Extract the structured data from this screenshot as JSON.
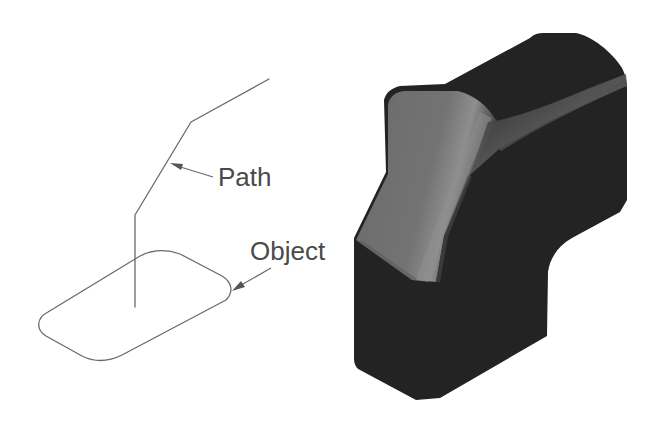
{
  "diagram": {
    "type": "sweep-illustration",
    "labels": {
      "path": "Path",
      "object": "Object"
    },
    "left_panel": {
      "description": "Wireframe: a polyline path rising from the center of a rounded profile",
      "path_points": [
        [
          135,
          307
        ],
        [
          135,
          215
        ],
        [
          191,
          122
        ],
        [
          269,
          79
        ]
      ],
      "profile_shape": "rounded-parallelogram"
    },
    "right_panel": {
      "description": "Resulting swept solid (dark shaded 3D object)"
    },
    "colors": {
      "background": "#ffffff",
      "line": "#6a6a6a",
      "label": "#4a4a4a",
      "solid_dark": "#222222",
      "solid_face": "#6e6e6e",
      "solid_highlight": "#8a8a8a"
    }
  }
}
